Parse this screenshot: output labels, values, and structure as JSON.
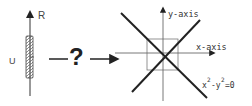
{
  "left_panel": {
    "axis_label": "R",
    "set_label": "U"
  },
  "middle": {
    "question_mark": "?"
  },
  "right_panel": {
    "y_axis_label": "y-axis",
    "x_axis_label": "x-axis",
    "equation": {
      "x_base": "x",
      "x_exp": "2",
      "minus": "-y",
      "y_exp": "2",
      "rhs": "=0"
    }
  },
  "colors": {
    "stroke": "#222222",
    "thin_stroke": "#555555",
    "background": "#ffffff"
  }
}
